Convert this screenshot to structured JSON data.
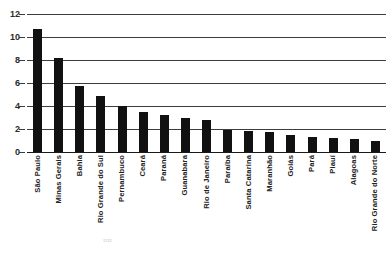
{
  "chart_data": {
    "type": "bar",
    "title": "",
    "subtitle": "",
    "xlabel": "",
    "ylabel": "",
    "ylim": [
      0,
      12
    ],
    "yticks": [
      "0",
      "2",
      "4",
      "6",
      "8",
      "10",
      "12"
    ],
    "grid": true,
    "legend": null,
    "orientation": "vertical",
    "bar_color": "#111111",
    "categories": [
      "São Paulo",
      "Minas Gerais",
      "Bahia",
      "Rio Grande do Sul",
      "Pernambuco",
      "Ceará",
      "Paraná",
      "Guanabara",
      "Rio de Janeiro",
      "Paraíba",
      "Santa Catarina",
      "Maranhão",
      "Goiás",
      "Pará",
      "Piauí",
      "Alagoas",
      "Rio Grande do Norte"
    ],
    "values": [
      10.7,
      8.2,
      5.7,
      4.9,
      4.0,
      3.5,
      3.2,
      3.0,
      2.8,
      1.9,
      1.85,
      1.7,
      1.5,
      1.3,
      1.2,
      1.1,
      1.0
    ]
  },
  "annotations": {
    "bleed_text": "¤¤"
  }
}
